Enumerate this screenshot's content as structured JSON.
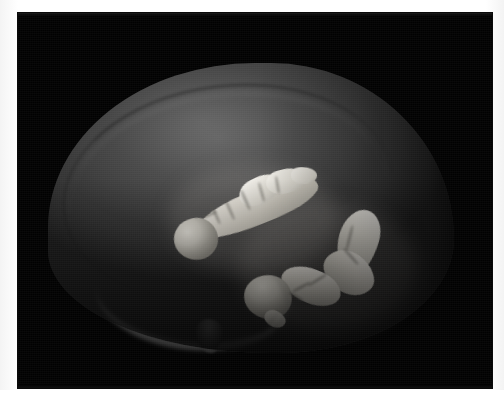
{
  "figure": {
    "name": "3d-brain-volume-render",
    "modality": "volumetric-3d-render",
    "background_color": "#010101",
    "page_background_color": "#ffffff",
    "panel": {
      "x": 18,
      "y": 13,
      "width": 474,
      "height": 375
    }
  },
  "render": {
    "subject_label": "brain",
    "view": "sagittal-lateral",
    "translucent_shell": {
      "name": "whole-brain-surface",
      "color": "#3e3e3e",
      "highlight_color": "#5c5c5c",
      "opacity_note": "semi-transparent"
    },
    "surface_features": [
      {
        "name": "cortical-arc-groove",
        "color": "#141414"
      },
      {
        "name": "ventral-white-matter-sweep",
        "color": "#787878"
      },
      {
        "name": "ventral-protrusion",
        "color": "#4a4a4a"
      }
    ],
    "structures": [
      {
        "name": "dorsal-hippocampus-left",
        "color": "#e3e0d8",
        "shading_dark": "#9d9a91",
        "position": "upper-left-of-center",
        "shape": "elongated-banana"
      },
      {
        "name": "ventral-hippocampus-right",
        "color": "#e3e0d8",
        "shading_dark": "#a29f96",
        "position": "lower-right-of-center",
        "shape": "c-shaped-arc"
      }
    ]
  },
  "caption": {
    "text": "",
    "visible": false,
    "note": "caption row is clipped at the page edge; no legible glyphs"
  }
}
